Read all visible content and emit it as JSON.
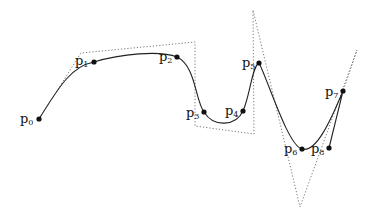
{
  "diagram": {
    "type": "spline-with-control-polygon",
    "colors": {
      "curve": "#222222",
      "polygon": "#777777",
      "point": "#111111",
      "background": "#ffffff"
    },
    "points": [
      {
        "name": "p",
        "index": "0",
        "x": 39,
        "y": 119,
        "lx": 20,
        "ly": 112
      },
      {
        "name": "p",
        "index": "1",
        "x": 94,
        "y": 62,
        "lx": 75,
        "ly": 54
      },
      {
        "name": "p",
        "index": "2",
        "x": 177,
        "y": 57,
        "lx": 159,
        "ly": 50
      },
      {
        "name": "p",
        "index": "3",
        "x": 204,
        "y": 112,
        "lx": 186,
        "ly": 106
      },
      {
        "name": "p",
        "index": "4",
        "x": 243,
        "y": 111,
        "lx": 225,
        "ly": 104
      },
      {
        "name": "p",
        "index": "5",
        "x": 259,
        "y": 63,
        "lx": 242,
        "ly": 56
      },
      {
        "name": "p",
        "index": "6",
        "x": 302,
        "y": 149,
        "lx": 284,
        "ly": 142
      },
      {
        "name": "p",
        "index": "7",
        "x": 343,
        "y": 91,
        "lx": 325,
        "ly": 85
      },
      {
        "name": "p",
        "index": "8",
        "x": 329,
        "y": 148,
        "lx": 311,
        "ly": 142
      }
    ],
    "control_polygon": [
      [
        39,
        119
      ],
      [
        81,
        53
      ],
      [
        195,
        42
      ],
      [
        195,
        126
      ],
      [
        254,
        134
      ],
      [
        253,
        10
      ],
      [
        300,
        207
      ],
      [
        357,
        50
      ],
      [
        343,
        91
      ]
    ],
    "curve_path": "M39,119 C60,85 72,66 94,62 C120,54 160,50 177,57 C196,66 195,100 204,112 C214,128 236,126 243,111 C250,96 252,66 259,63 C268,80 288,146 302,149 C316,153 330,122 343,91 L329,148"
  }
}
